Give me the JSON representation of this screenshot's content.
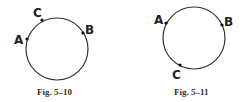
{
  "figures": [
    {
      "caption": "Fig. 5–10",
      "circle": {
        "cx": 57,
        "cy": 49,
        "r": 31
      },
      "points": [
        {
          "label": "A",
          "x": 27,
          "y": 39,
          "lx": 14,
          "ly": 44
        },
        {
          "label": "C",
          "x": 42,
          "y": 20,
          "lx": 33,
          "ly": 17
        },
        {
          "label": "B",
          "x": 83,
          "y": 33,
          "lx": 85,
          "ly": 34
        }
      ]
    },
    {
      "caption": "Fig. 5–11",
      "circle": {
        "cx": 194,
        "cy": 38,
        "r": 31
      },
      "points": [
        {
          "label": "A",
          "x": 166,
          "y": 23,
          "lx": 154,
          "ly": 24
        },
        {
          "label": "B",
          "x": 222,
          "y": 25,
          "lx": 224,
          "ly": 26
        },
        {
          "label": "C",
          "x": 180,
          "y": 65,
          "lx": 172,
          "ly": 79
        }
      ]
    }
  ],
  "colors": {
    "stroke": "#333333",
    "point": "#111111"
  }
}
